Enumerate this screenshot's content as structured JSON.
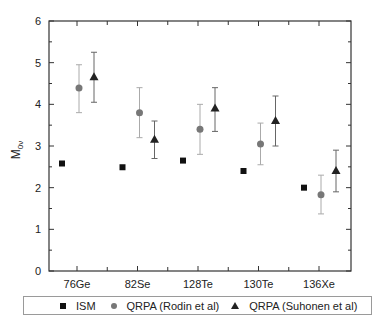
{
  "chart_data": {
    "type": "scatter",
    "title": "",
    "xlabel": "",
    "ylabel": "M0ν",
    "ylabel_main": "M",
    "ylabel_sub": "0ν",
    "ylim": [
      0,
      6
    ],
    "yticks": [
      0,
      1,
      2,
      3,
      4,
      5,
      6
    ],
    "grid": false,
    "legend_position": "bottom",
    "categories": [
      "76Ge",
      "82Se",
      "128Te",
      "130Te",
      "136Xe"
    ],
    "series": [
      {
        "name": "ISM",
        "marker": "square",
        "color": "#111111",
        "values": [
          2.58,
          2.49,
          2.65,
          2.4,
          2.0
        ],
        "error_low": null,
        "error_high": null
      },
      {
        "name": "QRPA (Rodin et al)",
        "marker": "circle",
        "color": "#777777",
        "values": [
          4.39,
          3.8,
          3.4,
          3.05,
          1.83
        ],
        "error_low": [
          3.8,
          3.2,
          2.8,
          2.55,
          1.37
        ],
        "error_high": [
          4.95,
          4.4,
          4.0,
          3.55,
          2.3
        ]
      },
      {
        "name": "QRPA (Suhonen et al)",
        "marker": "triangle",
        "color": "#222222",
        "values": [
          4.65,
          3.15,
          3.9,
          3.6,
          2.4
        ],
        "error_low": [
          4.05,
          2.7,
          3.35,
          3.0,
          1.9
        ],
        "error_high": [
          5.25,
          3.6,
          4.4,
          4.2,
          2.9
        ]
      }
    ]
  },
  "legend": {
    "items": [
      {
        "label": "ISM",
        "marker": "square"
      },
      {
        "label": "QRPA (Rodin et al)",
        "marker": "circle"
      },
      {
        "label": "QRPA (Suhonen et al)",
        "marker": "triangle"
      }
    ]
  }
}
